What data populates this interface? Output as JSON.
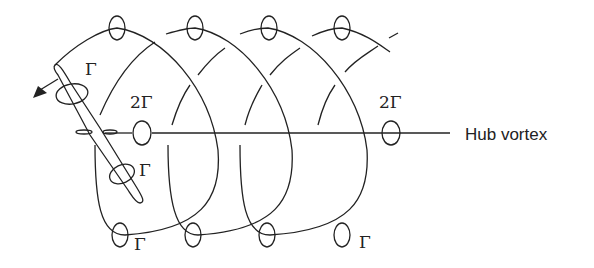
{
  "diagram": {
    "labels": {
      "gamma_blade_upper": "Γ",
      "gamma_blade_lower": "Γ",
      "hub_circulation_left": "2Γ",
      "hub_circulation_right": "2Γ",
      "gamma_bottom_left": "Γ",
      "gamma_bottom_right": "Γ",
      "hub_vortex": "Hub vortex"
    },
    "colors": {
      "stroke": "#222222",
      "background": "#ffffff"
    }
  }
}
